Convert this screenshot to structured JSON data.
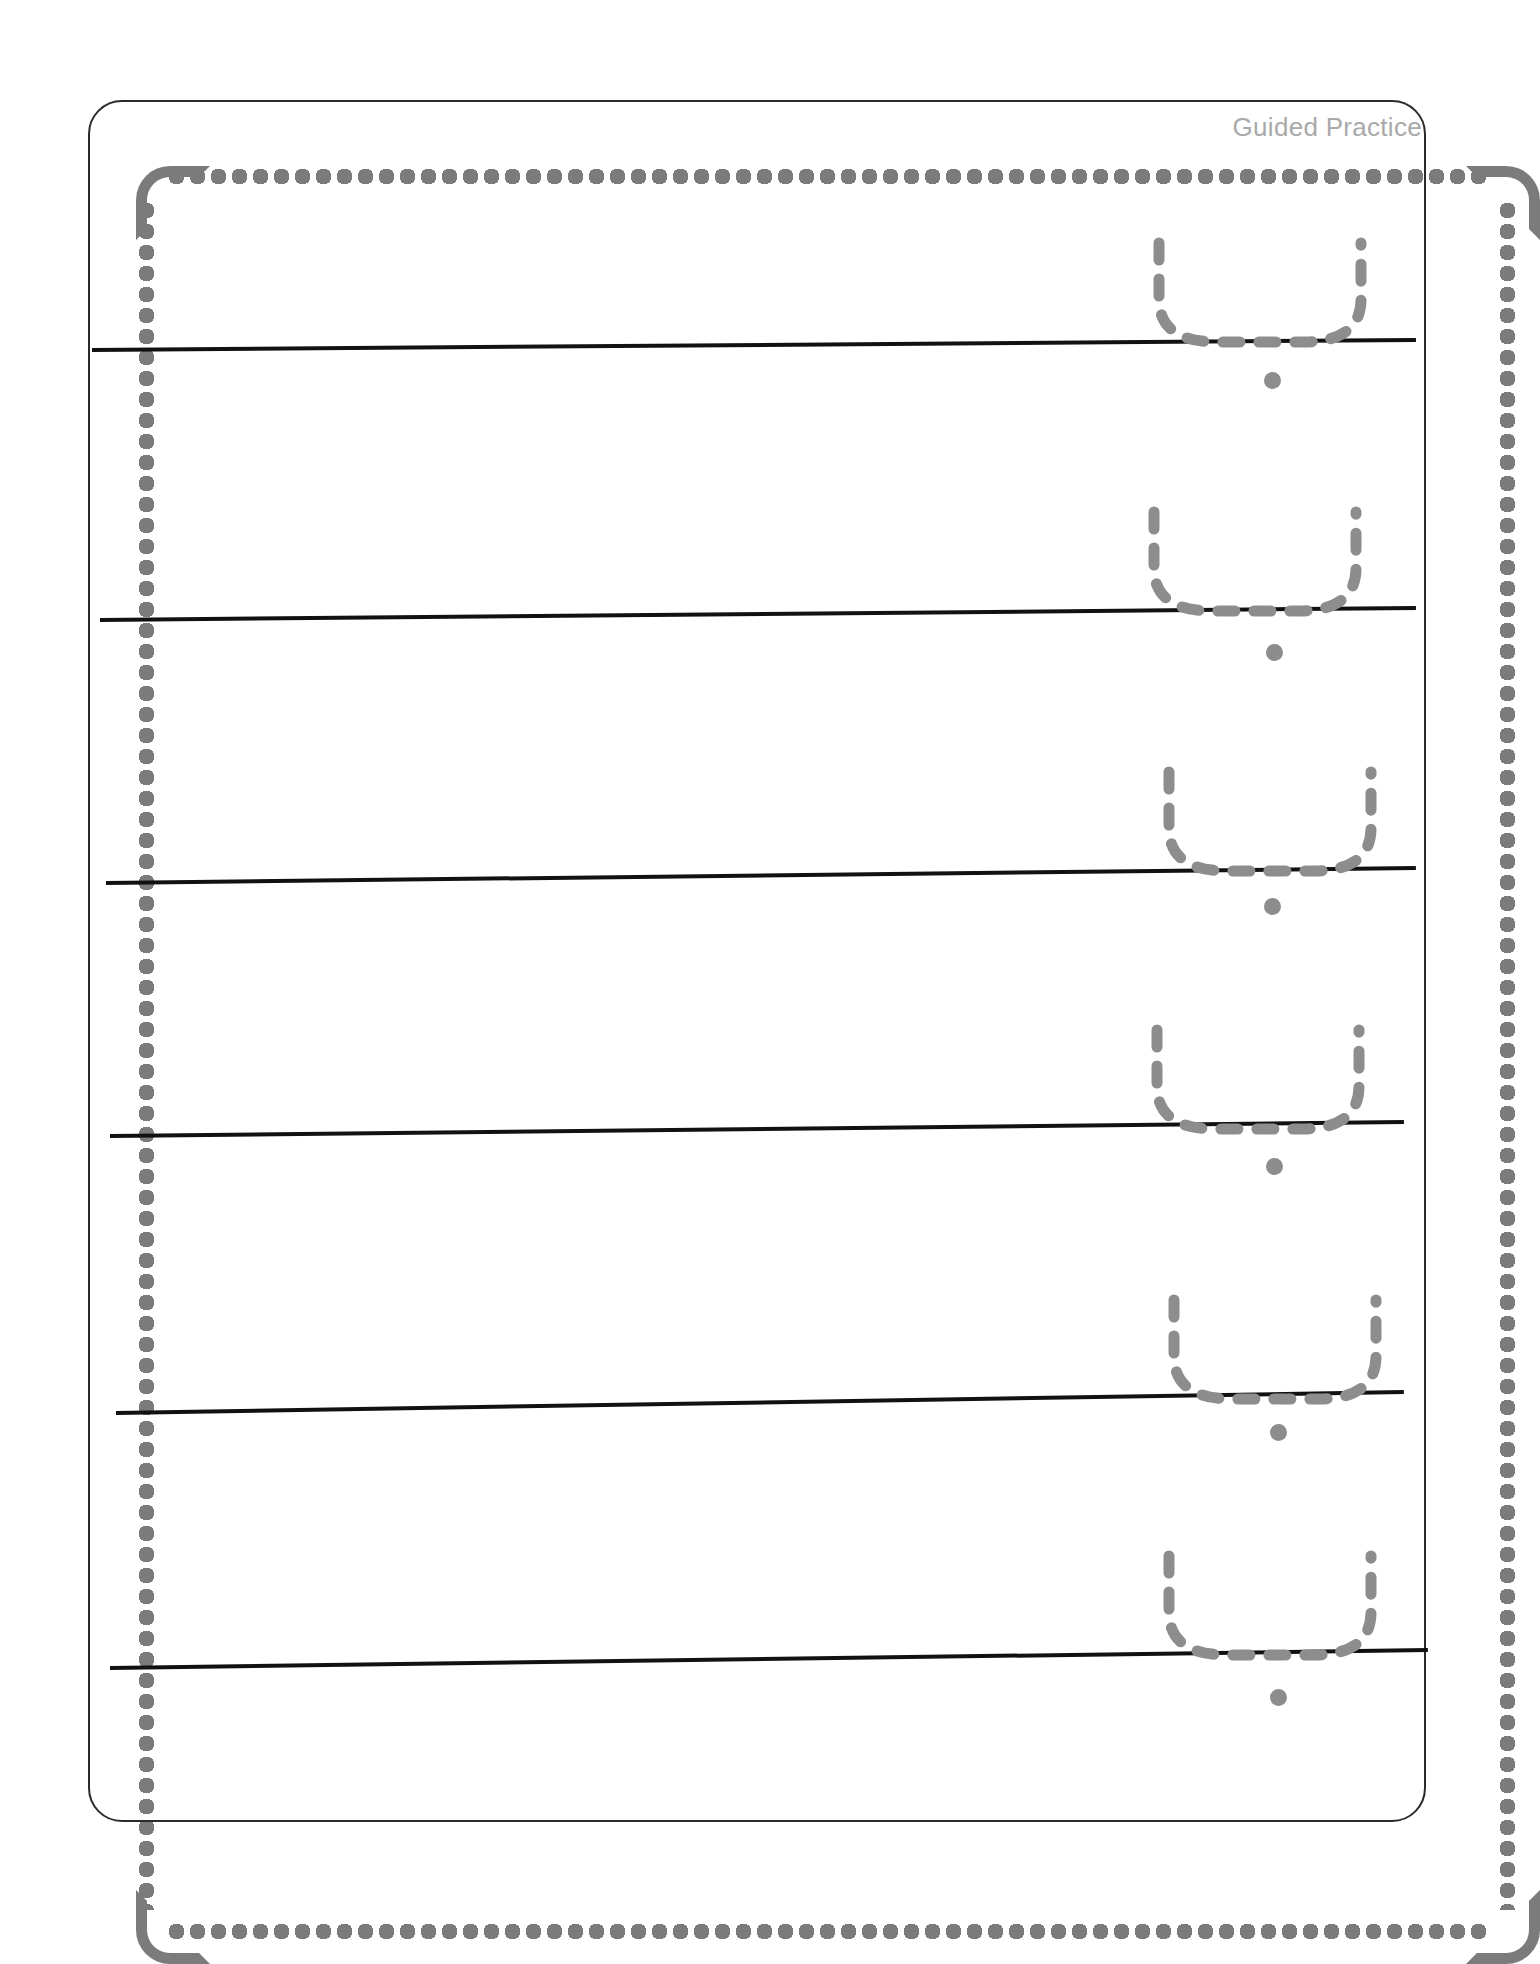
{
  "page": {
    "title": "Guided Practice",
    "kind": "handwriting-tracing-worksheet",
    "width": 1518,
    "height": 1925,
    "background_color": "#ffffff"
  },
  "frame": {
    "style": "scalloped",
    "scallop_color": "#7b7b7b",
    "inner_rule_color": "#2b2b2b",
    "corner_radius_px": 34,
    "left": 70,
    "top": 88,
    "width": 1374,
    "height": 1758
  },
  "header": {
    "label": "Guided Practice",
    "color": "#a9a9a9",
    "font_size_px": 26,
    "align": "right"
  },
  "tracing": {
    "glyph_name": "u-bowl-dashed-trace",
    "glyph_color": "#8d8d8d",
    "dash_pattern": "17 19",
    "stroke_width_px": 11,
    "dot_color": "#8d8d8d",
    "dot_diameter_px": 17,
    "baseline_color": "#111111",
    "baseline_thickness_px": 4
  },
  "rows": [
    {
      "index": 1,
      "baseline_left": 92,
      "baseline_right": 1416,
      "baseline_y_left": 350,
      "baseline_y_right": 340,
      "glyph_left": 1145,
      "glyph_top": 237,
      "dot_cx": 1272,
      "dot_cy": 380
    },
    {
      "index": 2,
      "baseline_left": 100,
      "baseline_right": 1416,
      "baseline_y_left": 620,
      "baseline_y_right": 608,
      "glyph_left": 1140,
      "glyph_top": 506,
      "dot_cx": 1274,
      "dot_cy": 652
    },
    {
      "index": 3,
      "baseline_left": 106,
      "baseline_right": 1416,
      "baseline_y_left": 883,
      "baseline_y_right": 868,
      "glyph_left": 1155,
      "glyph_top": 766,
      "dot_cx": 1272,
      "dot_cy": 906
    },
    {
      "index": 4,
      "baseline_left": 110,
      "baseline_right": 1404,
      "baseline_y_left": 1136,
      "baseline_y_right": 1122,
      "glyph_left": 1143,
      "glyph_top": 1024,
      "dot_cx": 1274,
      "dot_cy": 1166
    },
    {
      "index": 5,
      "baseline_left": 116,
      "baseline_right": 1404,
      "baseline_y_left": 1413,
      "baseline_y_right": 1392,
      "glyph_left": 1160,
      "glyph_top": 1294,
      "dot_cx": 1278,
      "dot_cy": 1432
    },
    {
      "index": 6,
      "baseline_left": 110,
      "baseline_right": 1428,
      "baseline_y_left": 1668,
      "baseline_y_right": 1650,
      "glyph_left": 1155,
      "glyph_top": 1550,
      "dot_cx": 1278,
      "dot_cy": 1697
    }
  ]
}
